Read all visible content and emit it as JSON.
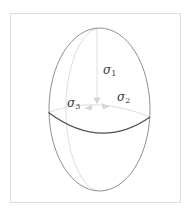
{
  "figure": {
    "type": "stress-ellipsoid-diagram",
    "labels": {
      "sigma1": {
        "symbol": "σ",
        "subscript": "1"
      },
      "sigma2": {
        "symbol": "σ",
        "subscript": "2"
      },
      "sigma3": {
        "symbol": "σ",
        "subscript": "3"
      }
    },
    "colors": {
      "background": "#ffffff",
      "frame": "#dddddd",
      "outline": "#8f8f8f",
      "equator": "#4f4f4f",
      "hidden_lines": "#dedede",
      "arrows": "#d5d5d5",
      "label_text": "#3a3a3a"
    }
  }
}
